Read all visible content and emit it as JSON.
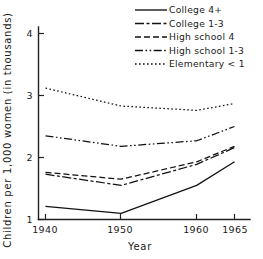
{
  "chart_data": {
    "type": "line",
    "title": "",
    "xlabel": "Year",
    "ylabel": "Children per 1,000 women (in thousands)",
    "x": [
      1940,
      1950,
      1960,
      1965
    ],
    "xtick_labels": [
      "1940",
      "1950",
      "1960",
      "1965"
    ],
    "ytick_labels": [
      "1",
      "2",
      "3",
      "4"
    ],
    "ytick_values": [
      1,
      2,
      3,
      4
    ],
    "xlim": [
      1936,
      1969
    ],
    "ylim": [
      1,
      4.3
    ],
    "grid": false,
    "legend_position": "top-right",
    "series": [
      {
        "name": "College 4+",
        "dash": "solid",
        "dasharray": "none",
        "color": "#111111",
        "values": [
          1.21,
          1.1,
          1.55,
          1.93
        ]
      },
      {
        "name": "College 1-3",
        "dash": "long-dash-dot",
        "dasharray": "9 2.5 3 2.5",
        "color": "#111111",
        "values": [
          1.73,
          1.55,
          1.89,
          2.16
        ]
      },
      {
        "name": "High school 4",
        "dash": "dashed",
        "dasharray": "6 3",
        "color": "#111111",
        "values": [
          1.76,
          1.65,
          1.93,
          2.18
        ]
      },
      {
        "name": "High school 1-3",
        "dash": "dash-dot-dot",
        "dasharray": "8 2.5 1.6 2.5 1.6 2.5",
        "color": "#111111",
        "values": [
          2.35,
          2.18,
          2.27,
          2.5
        ]
      },
      {
        "name": "Elementary < 1",
        "dash": "dotted",
        "dasharray": "1.6 2.4",
        "color": "#111111",
        "values": [
          3.12,
          2.83,
          2.76,
          2.87
        ]
      }
    ]
  },
  "legend": {
    "entries": [
      {
        "label": "College 4+"
      },
      {
        "label": "College 1-3"
      },
      {
        "label": "High school 4"
      },
      {
        "label": "High school 1-3"
      },
      {
        "label": "Elementary < 1"
      }
    ]
  },
  "axes": {
    "x_title": "Year",
    "y_title": "Children per 1,000 women (in thousands)",
    "x_ticks": [
      "1940",
      "1950",
      "1960",
      "1965"
    ],
    "y_ticks": [
      "4",
      "3",
      "2",
      "1"
    ]
  }
}
